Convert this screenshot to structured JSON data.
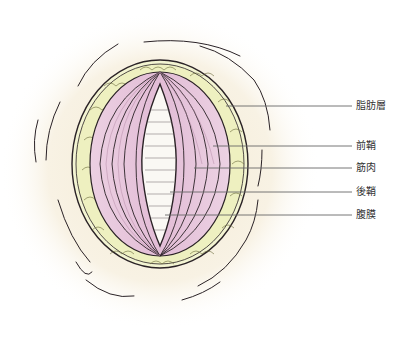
{
  "figure": {
    "type": "anatomical-illustration",
    "colors": {
      "background_glow": "#f6efdc",
      "fat": "#eef0c4",
      "muscle": "#e8c6dc",
      "muscle_dark": "#d9a9c6",
      "peritoneum": "#fbf8f2",
      "ink": "#2a2226",
      "leader": "#666666"
    }
  },
  "labels": [
    {
      "id": "fat-layer",
      "text": "脂肪層",
      "y": 106,
      "x_start": 226
    },
    {
      "id": "anterior-sheath",
      "text": "前鞘",
      "y": 146,
      "x_start": 213
    },
    {
      "id": "muscle",
      "text": "筋肉",
      "y": 168,
      "x_start": 194
    },
    {
      "id": "posterior-sheath",
      "text": "後鞘",
      "y": 192,
      "x_start": 170
    },
    {
      "id": "peritoneum",
      "text": "腹膜",
      "y": 215,
      "x_start": 165
    }
  ]
}
